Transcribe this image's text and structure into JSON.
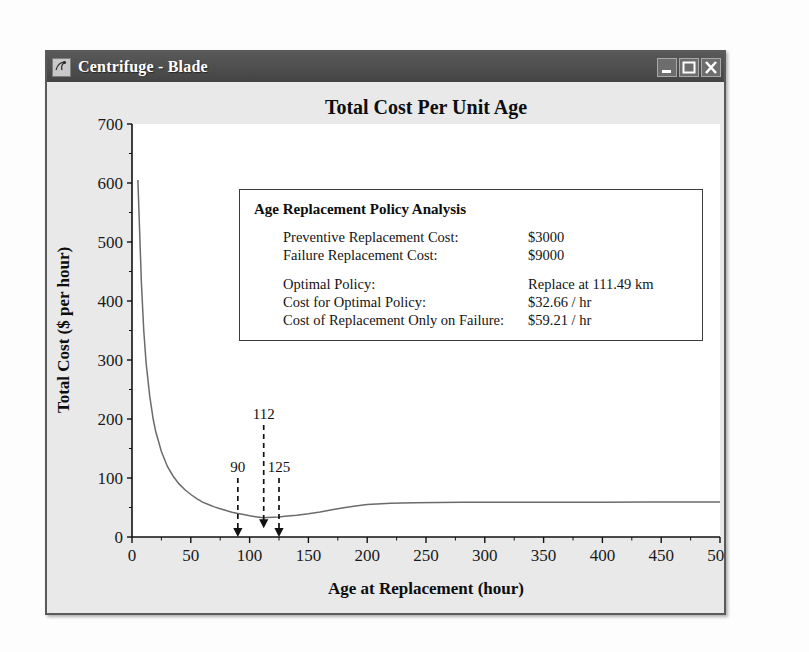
{
  "window": {
    "title": "Centrifuge - Blade",
    "icon": "app-icon",
    "buttons": {
      "minimize": "minimize-button",
      "maximize": "maximize-button",
      "close": "close-button"
    }
  },
  "infobox": {
    "heading": "Age Replacement Policy Analysis",
    "rows": [
      {
        "label": "Preventive Replacement Cost:",
        "value": "$3000"
      },
      {
        "label": "Failure Replacement Cost:",
        "value": "$9000"
      },
      {
        "label": "Optimal Policy:",
        "value": "Replace at 111.49 km"
      },
      {
        "label": "Cost for Optimal Policy:",
        "value": "$32.66 / hr"
      },
      {
        "label": "Cost of Replacement Only on Failure:",
        "value": "$59.21 / hr"
      }
    ]
  },
  "chart_data": {
    "type": "line",
    "title": "Total Cost Per Unit Age",
    "xlabel": "Age at Replacement (hour)",
    "ylabel": "Total Cost ($ per hour)",
    "xlim": [
      0,
      500
    ],
    "ylim": [
      0,
      700
    ],
    "xticks": [
      0,
      50,
      100,
      150,
      200,
      250,
      300,
      350,
      400,
      450,
      500
    ],
    "yticks": [
      0,
      100,
      200,
      300,
      400,
      500,
      600,
      700
    ],
    "grid": false,
    "legend": null,
    "line_color": "#6b6b6b",
    "series": [
      {
        "name": "Total cost per unit age",
        "x": [
          5,
          8,
          10,
          12,
          15,
          18,
          20,
          25,
          30,
          35,
          40,
          45,
          50,
          55,
          60,
          65,
          70,
          75,
          80,
          85,
          90,
          95,
          100,
          105,
          110,
          111.49,
          115,
          120,
          125,
          130,
          140,
          150,
          160,
          170,
          180,
          190,
          200,
          220,
          240,
          260,
          280,
          300,
          330,
          360,
          400,
          440,
          470,
          500
        ],
        "y": [
          605,
          430,
          350,
          295,
          240,
          200,
          180,
          145,
          120,
          103,
          90,
          80,
          72,
          65,
          59,
          55,
          51,
          48,
          45,
          42,
          40,
          38,
          36,
          34.5,
          33.2,
          32.66,
          33.0,
          33.4,
          34.0,
          35.0,
          37.0,
          39.5,
          42.5,
          46.0,
          49.5,
          52.5,
          55.0,
          57.3,
          58.2,
          58.6,
          58.8,
          58.9,
          59.0,
          59.05,
          59.1,
          59.15,
          59.18,
          59.21
        ]
      }
    ],
    "annotations": [
      {
        "label": "90",
        "x": 90,
        "arrow_top_value": 100,
        "arrow_bottom_value": 0
      },
      {
        "label": "112",
        "x": 112,
        "arrow_top_value": 190,
        "arrow_bottom_value": 15
      },
      {
        "label": "125",
        "x": 125,
        "arrow_top_value": 100,
        "arrow_bottom_value": 0
      }
    ]
  }
}
